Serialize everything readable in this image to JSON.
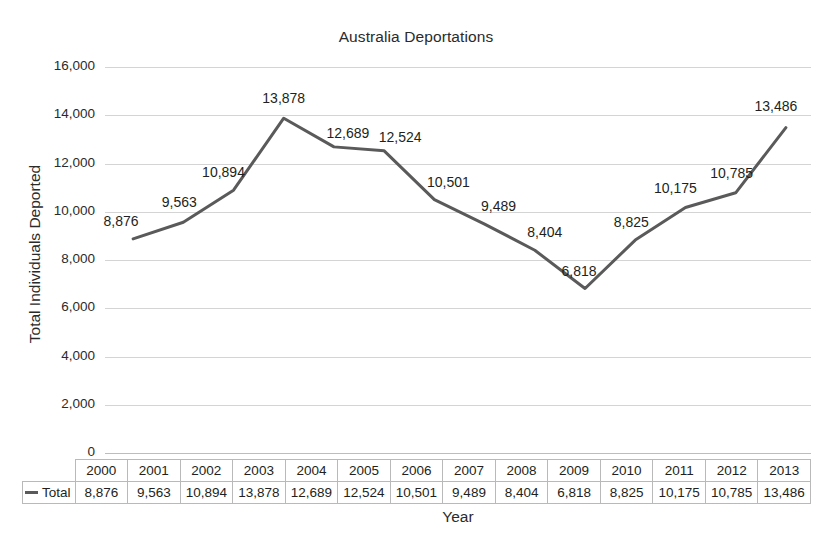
{
  "chart_data": {
    "type": "line",
    "title": "Australia Deportations",
    "xlabel": "Year",
    "ylabel": "Total Individuals Deported",
    "categories": [
      "2000",
      "2001",
      "2002",
      "2003",
      "2004",
      "2005",
      "2006",
      "2007",
      "2008",
      "2009",
      "2010",
      "2011",
      "2012",
      "2013"
    ],
    "values": [
      8876,
      9563,
      10894,
      13878,
      12689,
      12524,
      10501,
      9489,
      8404,
      6818,
      8825,
      10175,
      10785,
      13486
    ],
    "value_labels": [
      "8,876",
      "9,563",
      "10,894",
      "13,878",
      "12,689",
      "12,524",
      "10,501",
      "9,489",
      "8,404",
      "6,818",
      "8,825",
      "10,175",
      "10,785",
      "13,486"
    ],
    "series": [
      {
        "name": "Total",
        "color": "#5a5a5a",
        "values": [
          8876,
          9563,
          10894,
          13878,
          12689,
          12524,
          10501,
          9489,
          8404,
          6818,
          8825,
          10175,
          10785,
          13486
        ]
      }
    ],
    "ylim": [
      0,
      16000
    ],
    "ytick_step": 2000,
    "ytick_labels": [
      "16,000",
      "14,000",
      "12,000",
      "10,000",
      "8,000",
      "6,000",
      "4,000",
      "2,000",
      "0"
    ],
    "ytick_values": [
      16000,
      14000,
      12000,
      10000,
      8000,
      6000,
      4000,
      2000,
      0
    ],
    "grid": true,
    "legend": {
      "position": "bottom-table",
      "entries": [
        {
          "label": "Total",
          "color": "#5a5a5a"
        }
      ]
    },
    "data_table": {
      "header_row": [
        "2000",
        "2001",
        "2002",
        "2003",
        "2004",
        "2005",
        "2006",
        "2007",
        "2008",
        "2009",
        "2010",
        "2011",
        "2012",
        "2013"
      ],
      "rows": [
        {
          "label": "Total",
          "cells": [
            "8,876",
            "9,563",
            "10,894",
            "13,878",
            "12,689",
            "12,524",
            "10,501",
            "9,489",
            "8,404",
            "6,818",
            "8,825",
            "10,175",
            "10,785",
            "13,486"
          ]
        }
      ]
    }
  }
}
